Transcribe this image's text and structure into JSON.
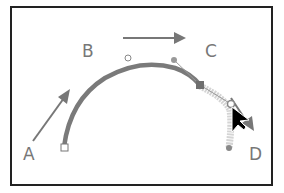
{
  "diagram": {
    "points": [
      {
        "id": "A",
        "label": "A"
      },
      {
        "id": "B",
        "label": "B"
      },
      {
        "id": "C",
        "label": "C"
      },
      {
        "id": "D",
        "label": "D"
      }
    ],
    "colors": {
      "frame": "#222222",
      "path": "#7a7a7a",
      "path_preview": "#c8c8c8",
      "arrow": "#777777",
      "label": "#777777",
      "cursor": "#000000"
    },
    "icons": {
      "cursor": "arrow-cursor-icon",
      "direction_arrows": "arrow-icon"
    }
  }
}
